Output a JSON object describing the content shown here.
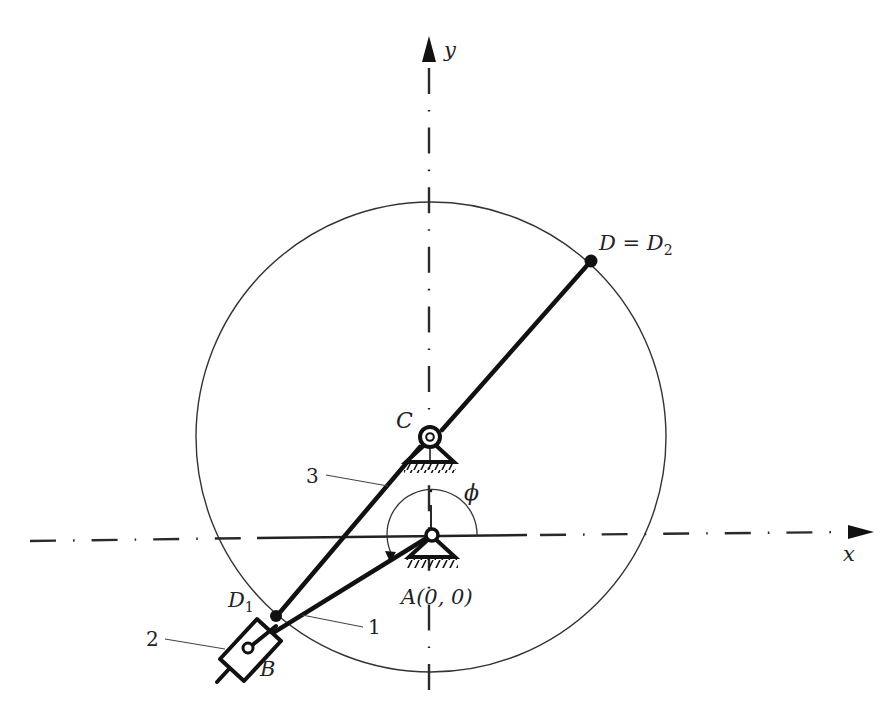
{
  "diagram": {
    "type": "planar-mechanism",
    "axes": {
      "x_label": "x",
      "y_label": "y"
    },
    "points": {
      "C": {
        "label": "C",
        "description": "fixed pivot of link 3 (circle center)"
      },
      "A": {
        "label": "A(0, 0)",
        "description": "fixed pivot of crank 1, origin"
      },
      "B": {
        "label": "B",
        "description": "slider pin on link 1"
      },
      "D": {
        "label": "D = D",
        "sub": "2",
        "description": "end of link 3 on circle"
      },
      "D1": {
        "label": "D",
        "sub": "1",
        "description": "point on link 3 near slider"
      }
    },
    "links": [
      {
        "number": "1",
        "description": "crank from A to B"
      },
      {
        "number": "2",
        "description": "slider block at B"
      },
      {
        "number": "3",
        "description": "link through C from D1 to D"
      }
    ],
    "angle": {
      "label": "ϕ",
      "description": "crank angle measured from x-axis at A"
    },
    "colors": {
      "ink": "#111111",
      "background": "#ffffff"
    }
  }
}
